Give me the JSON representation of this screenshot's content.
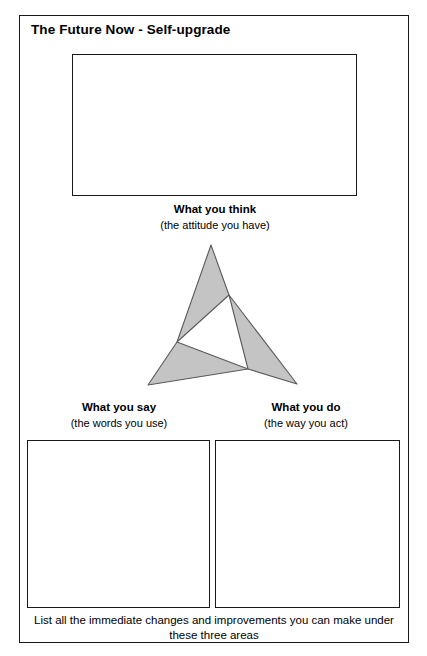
{
  "worksheet": {
    "title": "The Future Now - Self-upgrade",
    "footer_note": "List all the immediate changes and improvements you can make under these three areas"
  },
  "areas": [
    {
      "key": "think",
      "label": "What you think",
      "sublabel": "(the attitude you have)",
      "box_value": "",
      "box_placeholder": ""
    },
    {
      "key": "say",
      "label": "What you say",
      "sublabel": "(the words you use)",
      "box_value": "",
      "box_placeholder": ""
    },
    {
      "key": "do",
      "label": "What you do",
      "sublabel": "(the way you act)",
      "box_value": "",
      "box_placeholder": ""
    }
  ],
  "diagram": {
    "name": "triskelion-triangle",
    "fill_color": "#c4c4c4",
    "stroke_color": "#5a5a5a",
    "blades": [
      {
        "name": "top-blade",
        "points": "71,5 89,55 37,102"
      },
      {
        "name": "right-blade",
        "points": "89,55 108,129 157,144"
      },
      {
        "name": "left-blade",
        "points": "37,102 108,129 8,145"
      }
    ]
  },
  "colors": {
    "ink": "#1a1a1a",
    "paper": "#ffffff",
    "diagram_fill": "#c4c4c4",
    "diagram_stroke": "#5a5a5a"
  }
}
